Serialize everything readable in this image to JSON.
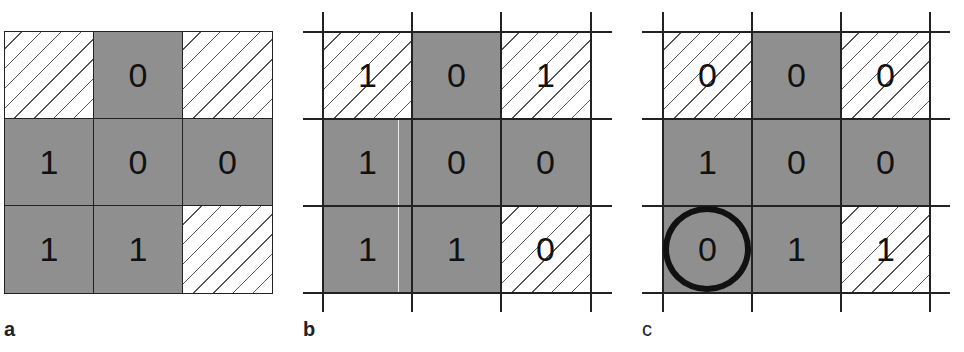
{
  "panels": [
    {
      "label": "a",
      "has_extended_gridlines": false,
      "cells": [
        {
          "value": "",
          "fill": "hatched"
        },
        {
          "value": "0",
          "fill": "gray"
        },
        {
          "value": "",
          "fill": "hatched"
        },
        {
          "value": "1",
          "fill": "gray"
        },
        {
          "value": "0",
          "fill": "gray"
        },
        {
          "value": "0",
          "fill": "gray"
        },
        {
          "value": "1",
          "fill": "gray"
        },
        {
          "value": "1",
          "fill": "gray"
        },
        {
          "value": "",
          "fill": "hatched"
        }
      ]
    },
    {
      "label": "b",
      "has_extended_gridlines": true,
      "cells": [
        {
          "value": "1",
          "fill": "hatched"
        },
        {
          "value": "0",
          "fill": "gray"
        },
        {
          "value": "1",
          "fill": "hatched"
        },
        {
          "value": "1",
          "fill": "gray"
        },
        {
          "value": "0",
          "fill": "gray"
        },
        {
          "value": "0",
          "fill": "gray"
        },
        {
          "value": "1",
          "fill": "gray"
        },
        {
          "value": "1",
          "fill": "gray"
        },
        {
          "value": "0",
          "fill": "hatched"
        }
      ]
    },
    {
      "label": "c",
      "has_extended_gridlines": true,
      "circled_cell": {
        "row": 3,
        "col": 1
      },
      "cells": [
        {
          "value": "0",
          "fill": "hatched"
        },
        {
          "value": "0",
          "fill": "gray"
        },
        {
          "value": "0",
          "fill": "hatched"
        },
        {
          "value": "1",
          "fill": "gray"
        },
        {
          "value": "0",
          "fill": "gray"
        },
        {
          "value": "0",
          "fill": "gray"
        },
        {
          "value": "0",
          "fill": "gray"
        },
        {
          "value": "1",
          "fill": "gray"
        },
        {
          "value": "1",
          "fill": "hatched"
        }
      ]
    }
  ],
  "colors": {
    "gray_fill": "#8f8f8f",
    "line": "#222222",
    "hatch": "#555555",
    "text": "#111111"
  }
}
